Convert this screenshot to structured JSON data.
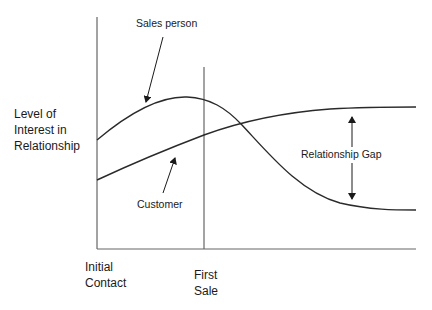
{
  "diagram": {
    "y_axis_label": [
      "Level of",
      "Interest in",
      "Relationship"
    ],
    "x_axis_labels": {
      "initial": [
        "Initial",
        "Contact"
      ],
      "first_sale": [
        "First",
        "Sale"
      ]
    },
    "curve_labels": {
      "sales_person": "Sales person",
      "customer": "Customer"
    },
    "gap_label": "Relationship Gap",
    "colors": {
      "line": "#2a2a2a",
      "axis": "#555555",
      "background": "#ffffff"
    }
  }
}
